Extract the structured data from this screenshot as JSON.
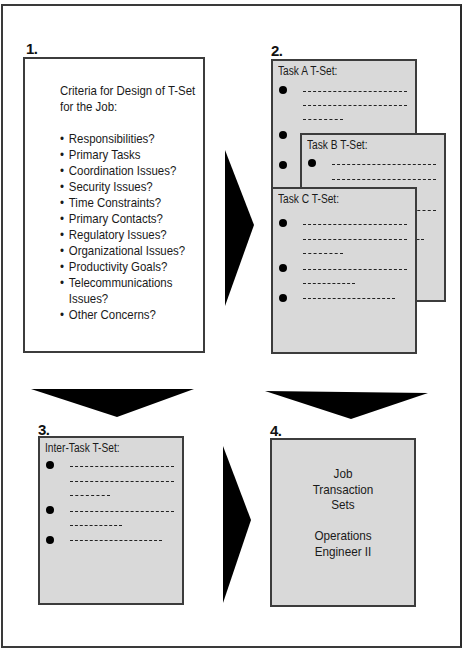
{
  "steps": {
    "step1": {
      "number": "1.",
      "title_line1": "Criteria for Design of T-Set",
      "title_line2": "for the Job:",
      "criteria": [
        "Responsibilities?",
        "Primary Tasks",
        "Coordination Issues?",
        "Security Issues?",
        "Time Constraints?",
        "Primary Contacts?",
        "Regulatory Issues?",
        "Organizational Issues?",
        "Productivity Goals?",
        "Telecommunications",
        "Other Concerns?"
      ],
      "criteria_continuation": "Issues?"
    },
    "step2": {
      "number": "2.",
      "task_sets": [
        {
          "title": "Task A T-Set:"
        },
        {
          "title": "Task B T-Set:"
        },
        {
          "title": "Task C T-Set:"
        }
      ]
    },
    "step3": {
      "number": "3.",
      "title": "Inter-Task T-Set:"
    },
    "step4": {
      "number": "4.",
      "line1": "Job",
      "line2": "Transaction",
      "line3": "Sets",
      "line4": "Operations",
      "line5": "Engineer II"
    }
  },
  "colors": {
    "box_fill": "#d9d9d9",
    "border": "#3c3c3c",
    "arrow": "#000000"
  },
  "icons": {
    "flow_arrow": "triangle-arrow",
    "bullet": "filled-circle"
  }
}
